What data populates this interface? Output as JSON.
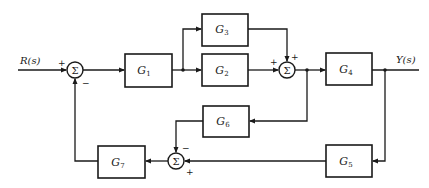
{
  "diagram": {
    "type": "control-system-block-diagram",
    "input_label": "R(s)",
    "output_label": "Y(s)",
    "summing_symbol": "Σ",
    "blocks": [
      {
        "id": "G1",
        "base": "G",
        "sub": "1"
      },
      {
        "id": "G2",
        "base": "G",
        "sub": "2"
      },
      {
        "id": "G3",
        "base": "G",
        "sub": "3"
      },
      {
        "id": "G4",
        "base": "G",
        "sub": "4"
      },
      {
        "id": "G5",
        "base": "G",
        "sub": "5"
      },
      {
        "id": "G6",
        "base": "G",
        "sub": "6"
      },
      {
        "id": "G7",
        "base": "G",
        "sub": "7"
      }
    ],
    "summing_junctions": [
      {
        "id": "S1",
        "signs": {
          "left": "+",
          "bottom": "−"
        }
      },
      {
        "id": "S2",
        "signs": {
          "left": "+",
          "top": "+"
        }
      },
      {
        "id": "S3",
        "signs": {
          "top": "−",
          "right": "+"
        }
      }
    ],
    "connections": [
      "R(s) → S1 (+)",
      "S1 → G1",
      "G1 → G2",
      "G1 → G3",
      "G2 → S2 (+)",
      "G3 → S2 (+)",
      "S2 → G4",
      "S2 → G6",
      "G4 → Y(s)",
      "Y(s) → G5",
      "G6 → S3 (−)",
      "G5 → S3 (+)",
      "S3 → G7",
      "G7 → S1 (−)"
    ]
  }
}
